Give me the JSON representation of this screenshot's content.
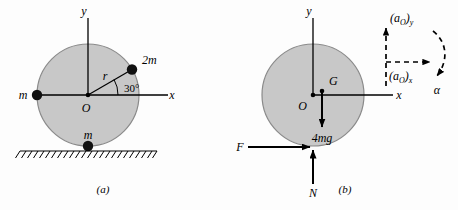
{
  "figure": {
    "background_color": "#fdfdfd",
    "disk_fill_color": "#c8c8c8",
    "disk_stroke_color": "#7a7a7a",
    "ink_color": "#000000"
  },
  "panel_a": {
    "caption": "(a)",
    "axis_y_label": "y",
    "axis_x_label": "x",
    "origin_label": "O",
    "radius_label": "r",
    "angle_label": "30°",
    "masses": [
      {
        "name": "mass-2m",
        "label": "2m",
        "position": "upper-right-edge-30deg"
      },
      {
        "name": "mass-m-left",
        "label": "m",
        "position": "left-edge"
      },
      {
        "name": "mass-m-bottom",
        "label": "m",
        "position": "bottom-contact-point"
      }
    ],
    "ground": "hatched-surface"
  },
  "panel_b": {
    "caption": "(b)",
    "axis_y_label": "y",
    "axis_x_label": "x",
    "origin_label": "O",
    "center_of_mass_label": "G",
    "weight_label": "4mg",
    "friction_force_label": "F",
    "normal_force_label": "N",
    "accel_y_label": "(aO)y",
    "accel_y_base": "(a",
    "accel_y_sub": "O",
    "accel_y_tail": ")",
    "accel_y_component": "y",
    "accel_x_base": "(a",
    "accel_x_sub": "O",
    "accel_x_tail": ")",
    "accel_x_component": "x",
    "angular_accel_label": "α"
  }
}
